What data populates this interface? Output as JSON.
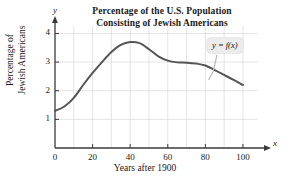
{
  "chart_data": {
    "type": "line",
    "title": "Percentage of the U.S. Population Consisting of Jewish Americans",
    "title_line_1": "Percentage of the U.S. Population",
    "title_line_2": "Consisting of Jewish Americans",
    "xlabel": "Years after 1900",
    "ylabel_line_1": "Percentage of",
    "ylabel_line_2": "Jewish Americans",
    "x_axis_name": "x",
    "y_axis_name": "y",
    "xlim": [
      0,
      108
    ],
    "ylim": [
      0,
      4.4
    ],
    "xticks": [
      0,
      20,
      40,
      60,
      80,
      100
    ],
    "yticks": [
      1,
      2,
      3,
      4
    ],
    "xtick_labels": [
      "0",
      "20",
      "40",
      "60",
      "80",
      "100"
    ],
    "ytick_labels": [
      "1",
      "2",
      "3",
      "4"
    ],
    "grid": true,
    "grid_x_step": 10,
    "grid_y_step": 1,
    "legend": "none",
    "annotations": [
      {
        "text": "y = f(x)",
        "x": 92,
        "y": 3.55
      }
    ],
    "series": [
      {
        "name": "f(x)",
        "color": "#555555",
        "x": [
          0,
          5,
          10,
          15,
          20,
          25,
          30,
          35,
          40,
          45,
          50,
          55,
          60,
          65,
          70,
          75,
          80,
          85,
          90,
          95,
          100
        ],
        "values": [
          1.3,
          1.45,
          1.75,
          2.2,
          2.62,
          3.0,
          3.35,
          3.6,
          3.7,
          3.66,
          3.45,
          3.2,
          3.05,
          2.99,
          2.98,
          2.95,
          2.88,
          2.72,
          2.55,
          2.38,
          2.2
        ]
      }
    ]
  },
  "colors": {
    "curve": "#555555",
    "axis": "#3a3a3a",
    "grid": "#d8d8d8",
    "callout_bg": "#ececec",
    "text": "#1a1a1a"
  }
}
